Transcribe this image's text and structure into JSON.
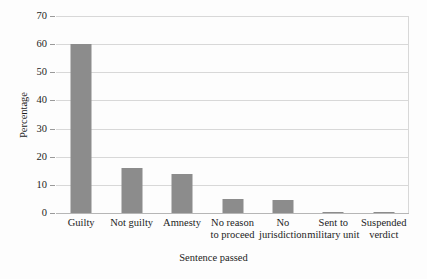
{
  "chart_data": {
    "type": "bar",
    "title": "",
    "xlabel": "Sentence passed",
    "ylabel": "Percentage",
    "categories": [
      "Guilty",
      "Not guilty",
      "Amnesty",
      "No reason\nto proceed",
      "No\njurisdiction",
      "Sent to\nmilitary unit",
      "Suspended\nverdict"
    ],
    "categories_extra": [
      "Suspended\nverdict"
    ],
    "values": [
      60,
      16,
      14,
      5,
      4.5,
      0.5,
      0.5
    ],
    "ylim": [
      0,
      70
    ],
    "yticks": [
      0,
      10,
      20,
      30,
      40,
      50,
      60,
      70
    ],
    "ytick_labels": [
      "0",
      "10",
      "20",
      "30",
      "40",
      "50",
      "60",
      "70"
    ],
    "grid": true,
    "legend": false,
    "bar_color": "#8c8c8c",
    "grid_color": "#d8d8d8",
    "axis_color": "#b6b6b6",
    "background": "#fdfdfd"
  }
}
